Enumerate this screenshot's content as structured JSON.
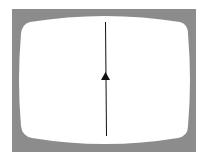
{
  "diagram": {
    "frame_color": "#8c8c8c",
    "screen_color": "#ffffff",
    "line_color": "#111111",
    "arrow_direction": "up"
  }
}
